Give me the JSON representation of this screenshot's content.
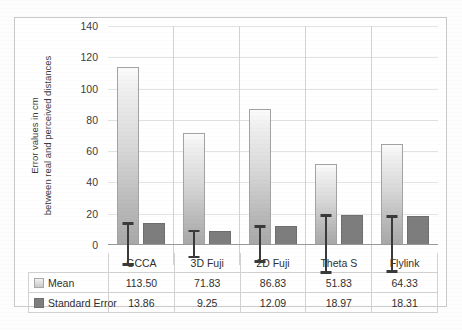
{
  "chart_data": {
    "type": "bar",
    "title": "",
    "xlabel": "",
    "ylabel": "Error values in cm between real and perceived distances",
    "ylabel_line1": "Error values in cm",
    "ylabel_line2": "between real and perceived distances",
    "categories": [
      "GCCA",
      "3D Fuji",
      "2D Fuji",
      "Theta S",
      "Flylink"
    ],
    "series": [
      {
        "name": "Mean",
        "values": [
          113.5,
          71.83,
          86.83,
          51.83,
          64.33
        ]
      },
      {
        "name": "Standard Error",
        "values": [
          13.86,
          9.25,
          12.09,
          18.97,
          18.31
        ]
      }
    ],
    "error_bars": {
      "applies_to": "Mean",
      "values": [
        13.86,
        9.25,
        12.09,
        18.97,
        18.31
      ]
    },
    "ylim": [
      0,
      140
    ],
    "yticks": [
      0,
      20,
      40,
      60,
      80,
      100,
      120,
      140
    ],
    "ytick_labels": [
      "0",
      "20",
      "40",
      "60",
      "80",
      "100",
      "120",
      "140"
    ],
    "grid": true,
    "legend_position": "data-table",
    "colors": {
      "mean_bar": "#d8d8d8",
      "se_bar": "#7d7d7d",
      "error_bar": "#3a3a3a",
      "gridline": "#e2e2e2",
      "border": "#c9c9c9"
    }
  },
  "data_table": {
    "header_row": [
      "",
      "GCCA",
      "3D Fuji",
      "2D Fuji",
      "Theta S",
      "Flylink"
    ],
    "rows": [
      {
        "label": "Mean",
        "swatch": "mean-swatch",
        "cells": [
          "113.50",
          "71.83",
          "86.83",
          "51.83",
          "64.33"
        ]
      },
      {
        "label": "Standard Error",
        "swatch": "se-swatch",
        "cells": [
          "13.86",
          "9.25",
          "12.09",
          "18.97",
          "18.31"
        ]
      }
    ]
  }
}
